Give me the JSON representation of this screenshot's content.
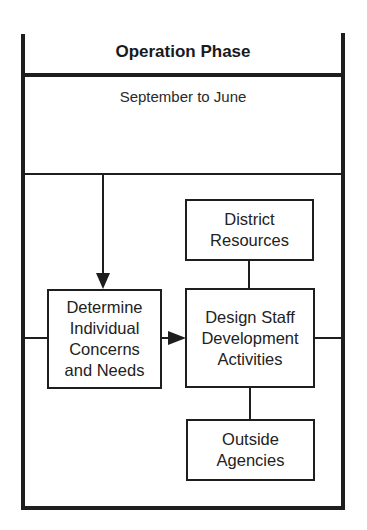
{
  "diagram": {
    "title": "Operation Phase",
    "subtitle": "September to June",
    "nodes": [
      {
        "id": "determine",
        "label": "Determine Individual Concerns and Needs",
        "lines": [
          "Determine",
          "Individual",
          "Concerns",
          "and Needs"
        ]
      },
      {
        "id": "district",
        "label": "District Resources",
        "lines": [
          "District",
          "Resources"
        ]
      },
      {
        "id": "design",
        "label": "Design Staff Development Activities",
        "lines": [
          "Design Staff",
          "Development",
          "Activities"
        ]
      },
      {
        "id": "outside",
        "label": "Outside Agencies",
        "lines": [
          "Outside",
          "Agencies"
        ]
      }
    ],
    "edges": [
      {
        "from": "subtitle-section",
        "to": "determine",
        "type": "arrow"
      },
      {
        "from": "determine",
        "to": "design",
        "type": "arrow"
      },
      {
        "from": "district",
        "to": "design",
        "type": "line"
      },
      {
        "from": "design",
        "to": "outside",
        "type": "line"
      },
      {
        "from": "left-border",
        "to": "determine",
        "type": "line"
      },
      {
        "from": "design",
        "to": "right-border",
        "type": "line"
      }
    ],
    "colors": {
      "line": "#1e1e1e",
      "text": "#222222",
      "background": "#ffffff"
    }
  }
}
